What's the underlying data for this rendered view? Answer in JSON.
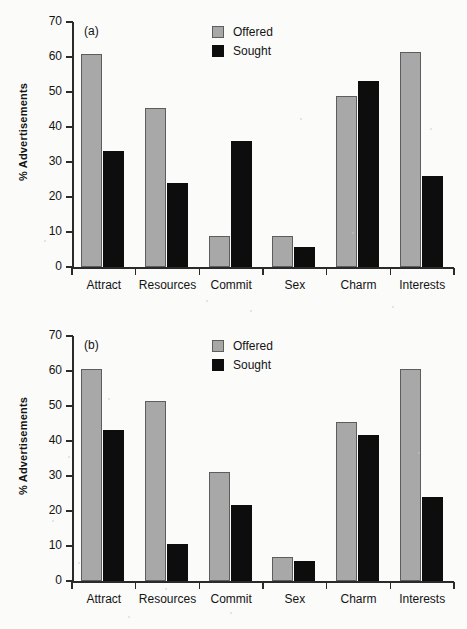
{
  "figure": {
    "background_color": "#fbfbfa",
    "offered_color": "#a8a8a8",
    "sought_color": "#0d0d0d"
  },
  "chart_data": [
    {
      "type": "bar",
      "title": "(a)",
      "panel_label": "(a)",
      "xlabel": "",
      "ylabel": "% Advertisements",
      "ylim": [
        0,
        70
      ],
      "yticks": [
        0,
        10,
        20,
        30,
        40,
        50,
        60,
        70
      ],
      "ytick_labels": [
        "0",
        "10",
        "20",
        "30",
        "40",
        "50",
        "60",
        "70"
      ],
      "grid": false,
      "legend_position": "top-center",
      "categories": [
        "Attract",
        "Resources",
        "Commit",
        "Sex",
        "Charm",
        "Interests"
      ],
      "series": [
        {
          "name": "Offered",
          "color": "#a8a8a8",
          "values": [
            61,
            45.5,
            9,
            9,
            48.8,
            61.3
          ]
        },
        {
          "name": "Sought",
          "color": "#0d0d0d",
          "values": [
            33.2,
            24,
            36,
            5.6,
            53.2,
            26
          ]
        }
      ]
    },
    {
      "type": "bar",
      "title": "(b)",
      "panel_label": "(b)",
      "xlabel": "",
      "ylabel": "% Advertisements",
      "ylim": [
        0,
        70
      ],
      "yticks": [
        0,
        10,
        20,
        30,
        40,
        50,
        60,
        70
      ],
      "ytick_labels": [
        "0",
        "10",
        "20",
        "30",
        "40",
        "50",
        "60",
        "70"
      ],
      "grid": false,
      "legend_position": "top-center",
      "categories": [
        "Attract",
        "Resources",
        "Commit",
        "Sex",
        "Charm",
        "Interests"
      ],
      "series": [
        {
          "name": "Offered",
          "color": "#a8a8a8",
          "values": [
            60.5,
            51.4,
            31.2,
            7,
            45.5,
            60.6
          ]
        },
        {
          "name": "Sought",
          "color": "#0d0d0d",
          "values": [
            43.1,
            10.5,
            21.8,
            5.6,
            41.8,
            24
          ]
        }
      ]
    }
  ]
}
